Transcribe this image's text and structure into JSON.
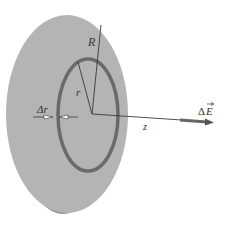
{
  "diagram": {
    "labels": {
      "disk_radius": "R",
      "ring_radius": "r",
      "ring_width": "Δr",
      "axis": "z",
      "field_delta": "Δ",
      "field_symbol": "E"
    },
    "colors": {
      "disk_fill": "#b4b4b4",
      "disk_edge": "#8e8e8e",
      "ring": "#6a6a6a",
      "lines": "#3a3a3a",
      "field_arrow": "#666666",
      "background": "#ffffff"
    }
  }
}
